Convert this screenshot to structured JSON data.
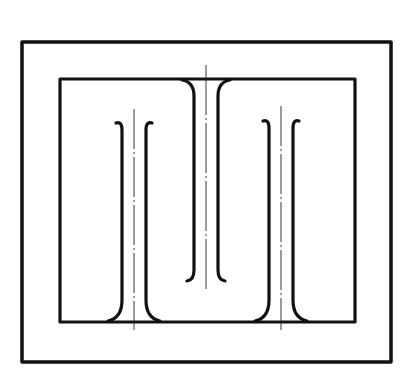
{
  "diagram": {
    "type": "technical-line-drawing",
    "colors": {
      "line": "#111111",
      "background": "#ffffff"
    },
    "outer_frame": {
      "x": 22,
      "y": 42,
      "width": 369,
      "height": 320,
      "stroke_width": 3.5
    },
    "inner_frame": {
      "x": 60,
      "y": 79,
      "width": 295,
      "height": 243,
      "stroke_width": 3.2
    },
    "ribs": [
      {
        "id": "left-rib",
        "anchor": "bottom",
        "center_x": 134,
        "half_gap": 12,
        "top_y": 120,
        "base_y": 322,
        "axis": {
          "y1": 109,
          "y2": 330
        }
      },
      {
        "id": "center-rib",
        "anchor": "top",
        "center_x": 206,
        "half_gap": 12,
        "top_y": 79,
        "base_y": 280,
        "axis": {
          "y1": 65,
          "y2": 290
        }
      },
      {
        "id": "right-rib",
        "anchor": "bottom",
        "center_x": 281,
        "half_gap": 12,
        "top_y": 118,
        "base_y": 322,
        "axis": {
          "y1": 106,
          "y2": 330
        }
      }
    ]
  }
}
